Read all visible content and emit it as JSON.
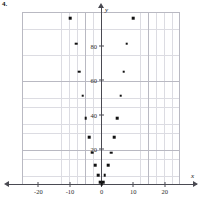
{
  "problem_number": "4.",
  "chart_data": {
    "type": "scatter",
    "title": "",
    "xlabel": "x",
    "ylabel": "y",
    "xlim": [
      -25,
      25
    ],
    "ylim": [
      -5,
      100
    ],
    "grid": true,
    "legend": "none",
    "xticks": [
      -20,
      -10,
      0,
      10,
      20
    ],
    "xtick_labels": [
      "-20",
      "-10",
      "0",
      "10",
      "20"
    ],
    "yticks": [
      20,
      40,
      60,
      80
    ],
    "ytick_labels": [
      "20",
      "40",
      "60",
      "80"
    ],
    "point_color": "#111111",
    "grid_color": "#dcdce2",
    "axis_color": "#4a4a52",
    "series": [
      {
        "name": "data",
        "points": [
          [
            -10,
            96
          ],
          [
            -8,
            81
          ],
          [
            -7,
            65
          ],
          [
            -6,
            51
          ],
          [
            -5,
            38
          ],
          [
            -4,
            27
          ],
          [
            -3,
            18
          ],
          [
            -2,
            11
          ],
          [
            -1,
            5
          ],
          [
            -0.5,
            1
          ],
          [
            0,
            0
          ],
          [
            0.5,
            1
          ],
          [
            1,
            5
          ],
          [
            2,
            11
          ],
          [
            3,
            18
          ],
          [
            4,
            27
          ],
          [
            5,
            38
          ],
          [
            6,
            51
          ],
          [
            7,
            65
          ],
          [
            8,
            81
          ],
          [
            10,
            96
          ]
        ]
      }
    ]
  }
}
